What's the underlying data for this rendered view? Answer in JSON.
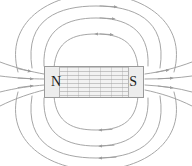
{
  "diagram": {
    "type": "physics-field-line-diagram",
    "background_color": "#ffffff",
    "magnet": {
      "label_north": "N",
      "label_south": "S",
      "north_pole_side": "left",
      "south_pole_side": "right",
      "fill_color": "#f2f2f2",
      "hatch_color": "#a0a0a0",
      "border_color": "#9a9a9a",
      "label_color": "#1c1c1c",
      "x": 44,
      "y": 66,
      "width": 100,
      "height": 32
    },
    "field_lines": {
      "line_color": "#9c9c9c",
      "line_width": 0.9,
      "arrow_color": "#9c9c9c",
      "arrow_direction": "north-to-south-outside",
      "loop_count_per_side": 4,
      "description": "Nested closed loops exiting the south pole and re-entering the north pole"
    }
  }
}
